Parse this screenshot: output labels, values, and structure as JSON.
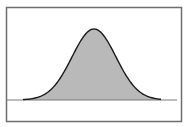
{
  "diagram": {
    "type": "normal-distribution-curve",
    "colors": {
      "background": "#ffffff",
      "frame": "#6e6e6e",
      "baseline": "#7a7a7a",
      "curve_stroke": "#1a1a1a",
      "fill": "#b9b9b9"
    },
    "frame": {
      "x": 6.5,
      "y": 7.5,
      "width": 175,
      "height": 114
    },
    "baseline": {
      "x1": 7,
      "x2": 177,
      "y": 100
    },
    "curve": {
      "mean_x": 94,
      "sigma_px": 22,
      "peak_y": 29,
      "base_y": 100,
      "x_start": 23,
      "x_end": 161
    }
  }
}
